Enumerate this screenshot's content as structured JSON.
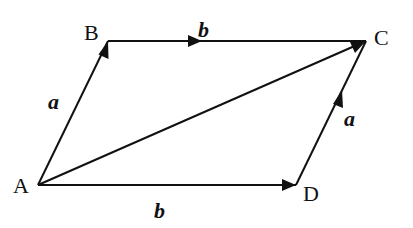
{
  "diagram": {
    "type": "vector-parallelogram",
    "points": {
      "A": {
        "label": "A",
        "x": 38,
        "y": 185
      },
      "B": {
        "label": "B",
        "x": 108,
        "y": 41
      },
      "C": {
        "label": "C",
        "x": 366,
        "y": 41
      },
      "D": {
        "label": "D",
        "x": 296,
        "y": 185
      }
    },
    "vectors": [
      {
        "from": "A",
        "to": "B",
        "label": "a"
      },
      {
        "from": "B",
        "to": "C",
        "label": "b"
      },
      {
        "from": "A",
        "to": "D",
        "label": "b"
      },
      {
        "from": "D",
        "to": "C",
        "label": "a"
      },
      {
        "from": "A",
        "to": "C",
        "label": ""
      }
    ],
    "labels": {
      "A": "A",
      "B": "B",
      "C": "C",
      "D": "D",
      "ab": "a",
      "bc": "b",
      "ad": "b",
      "dc": "a"
    },
    "colors": {
      "stroke": "#111111",
      "background": "#ffffff"
    }
  }
}
